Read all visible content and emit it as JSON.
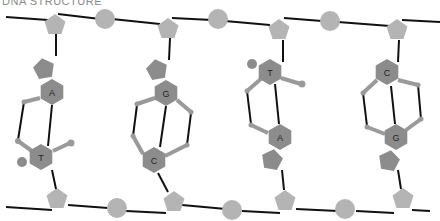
{
  "title": "DNA STRUCTURE",
  "colors": {
    "backbone_line": "#111111",
    "sugar_phosphate": "#b4b4b4",
    "base": "#8c8c8c",
    "base_pentagon": "#8c8c8c",
    "atom_dot": "#9a9a9a",
    "hydrogen_bond": "#111111",
    "background": "#ffffff"
  },
  "base_pairs": [
    {
      "top": "A",
      "bottom": "T"
    },
    {
      "top": "G",
      "bottom": "C"
    },
    {
      "top": "T",
      "bottom": "A"
    },
    {
      "top": "C",
      "bottom": "G"
    }
  ]
}
